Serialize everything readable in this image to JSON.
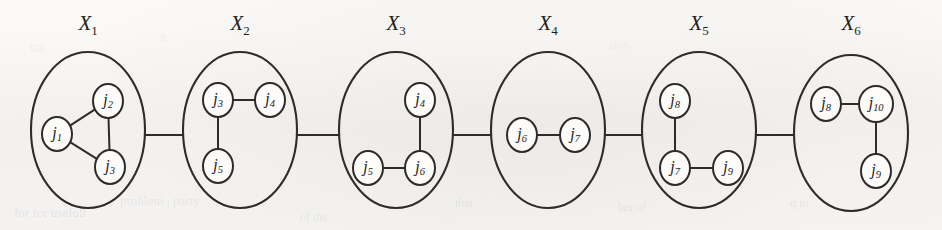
{
  "figure": {
    "type": "junction-tree-diagram",
    "background_color": "#faf9f7",
    "ink_color": "#2d2c2a",
    "node_fill": "#fdfcfa",
    "clusters": [
      {
        "id": "X1",
        "label_base": "X",
        "label_sub": "1",
        "label_x": 88,
        "label_y": 25,
        "cx": 88,
        "cy": 130,
        "rx": 57,
        "ry": 78,
        "nodes": [
          {
            "id": "n1",
            "base": "j",
            "sub": "1",
            "x": 57,
            "y": 134,
            "rx": 15,
            "ry": 17
          },
          {
            "id": "n2",
            "base": "j",
            "sub": "2",
            "x": 108,
            "y": 101,
            "rx": 15,
            "ry": 17
          },
          {
            "id": "n3",
            "base": "j",
            "sub": "3",
            "x": 110,
            "y": 167,
            "rx": 15,
            "ry": 17
          }
        ],
        "edges": [
          {
            "from": "n1",
            "to": "n2"
          },
          {
            "from": "n1",
            "to": "n3"
          },
          {
            "from": "n2",
            "to": "n3"
          }
        ]
      },
      {
        "id": "X2",
        "label_base": "X",
        "label_sub": "2",
        "label_x": 240,
        "label_y": 25,
        "cx": 240,
        "cy": 130,
        "rx": 57,
        "ry": 78,
        "nodes": [
          {
            "id": "n3",
            "base": "j",
            "sub": "3",
            "x": 218,
            "y": 100,
            "rx": 15,
            "ry": 17
          },
          {
            "id": "n4",
            "base": "j",
            "sub": "4",
            "x": 270,
            "y": 100,
            "rx": 15,
            "ry": 17
          },
          {
            "id": "n5",
            "base": "j",
            "sub": "5",
            "x": 218,
            "y": 166,
            "rx": 15,
            "ry": 17
          }
        ],
        "edges": [
          {
            "from": "n3",
            "to": "n4"
          },
          {
            "from": "n3",
            "to": "n5"
          }
        ]
      },
      {
        "id": "X3",
        "label_base": "X",
        "label_sub": "3",
        "label_x": 396,
        "label_y": 25,
        "cx": 396,
        "cy": 130,
        "rx": 57,
        "ry": 78,
        "nodes": [
          {
            "id": "n4",
            "base": "j",
            "sub": "4",
            "x": 420,
            "y": 100,
            "rx": 15,
            "ry": 17
          },
          {
            "id": "n5",
            "base": "j",
            "sub": "5",
            "x": 368,
            "y": 168,
            "rx": 15,
            "ry": 17
          },
          {
            "id": "n6",
            "base": "j",
            "sub": "6",
            "x": 420,
            "y": 168,
            "rx": 15,
            "ry": 17
          }
        ],
        "edges": [
          {
            "from": "n4",
            "to": "n6"
          },
          {
            "from": "n5",
            "to": "n6"
          }
        ]
      },
      {
        "id": "X4",
        "label_base": "X",
        "label_sub": "4",
        "label_x": 548,
        "label_y": 25,
        "cx": 548,
        "cy": 130,
        "rx": 57,
        "ry": 78,
        "nodes": [
          {
            "id": "n6",
            "base": "j",
            "sub": "6",
            "x": 522,
            "y": 135,
            "rx": 15,
            "ry": 17
          },
          {
            "id": "n7",
            "base": "j",
            "sub": "7",
            "x": 575,
            "y": 135,
            "rx": 15,
            "ry": 17
          }
        ],
        "edges": [
          {
            "from": "n6",
            "to": "n7"
          }
        ]
      },
      {
        "id": "X5",
        "label_base": "X",
        "label_sub": "5",
        "label_x": 699,
        "label_y": 25,
        "cx": 699,
        "cy": 130,
        "rx": 57,
        "ry": 78,
        "nodes": [
          {
            "id": "n8",
            "base": "j",
            "sub": "8",
            "x": 675,
            "y": 101,
            "rx": 15,
            "ry": 17
          },
          {
            "id": "n7",
            "base": "j",
            "sub": "7",
            "x": 675,
            "y": 168,
            "rx": 15,
            "ry": 17
          },
          {
            "id": "n9",
            "base": "j",
            "sub": "9",
            "x": 728,
            "y": 168,
            "rx": 15,
            "ry": 17
          }
        ],
        "edges": [
          {
            "from": "n8",
            "to": "n7"
          },
          {
            "from": "n7",
            "to": "n9"
          }
        ]
      },
      {
        "id": "X6",
        "label_base": "X",
        "label_sub": "6",
        "label_x": 851,
        "label_y": 25,
        "cx": 851,
        "cy": 133,
        "rx": 57,
        "ry": 78,
        "nodes": [
          {
            "id": "n8",
            "base": "j",
            "sub": "8",
            "x": 826,
            "y": 104,
            "rx": 15,
            "ry": 17
          },
          {
            "id": "n10",
            "base": "j",
            "sub": "10",
            "x": 876,
            "y": 104,
            "rx": 17,
            "ry": 18
          },
          {
            "id": "n9",
            "base": "j",
            "sub": "9",
            "x": 876,
            "y": 171,
            "rx": 15,
            "ry": 17
          }
        ],
        "edges": [
          {
            "from": "n8",
            "to": "n10"
          },
          {
            "from": "n10",
            "to": "n9"
          }
        ]
      }
    ],
    "separators": [
      {
        "id": "S1",
        "from": "X1",
        "to": "X2",
        "x1": 145,
        "x2": 183,
        "y": 135
      },
      {
        "id": "S2",
        "from": "X2",
        "to": "X3",
        "x1": 297,
        "x2": 339,
        "y": 135
      },
      {
        "id": "S3",
        "from": "X3",
        "to": "X4",
        "x1": 453,
        "x2": 491,
        "y": 135
      },
      {
        "id": "S4",
        "from": "X4",
        "to": "X5",
        "x1": 605,
        "x2": 642,
        "y": 135
      },
      {
        "id": "S5",
        "from": "X5",
        "to": "X6",
        "x1": 756,
        "x2": 794,
        "y": 135
      }
    ],
    "scan_artifacts": [
      {
        "text": "for for usefull",
        "x": 14,
        "y": 205,
        "size": 13,
        "opacity": 0.15
      },
      {
        "text": "problem , party",
        "x": 120,
        "y": 193,
        "size": 13,
        "opacity": 0.13
      },
      {
        "text": "of the",
        "x": 300,
        "y": 210,
        "size": 12,
        "opacity": 0.12
      },
      {
        "text": "that",
        "x": 455,
        "y": 196,
        "size": 12,
        "opacity": 0.12
      },
      {
        "text": "ber of",
        "x": 618,
        "y": 200,
        "size": 12,
        "opacity": 0.12
      },
      {
        "text": "q to",
        "x": 790,
        "y": 196,
        "size": 12,
        "opacity": 0.12
      },
      {
        "text": "unt",
        "x": 30,
        "y": 40,
        "size": 12,
        "opacity": 0.1
      },
      {
        "text": "n",
        "x": 160,
        "y": 30,
        "size": 12,
        "opacity": 0.1
      },
      {
        "text": "tion",
        "x": 610,
        "y": 38,
        "size": 12,
        "opacity": 0.1
      }
    ]
  }
}
